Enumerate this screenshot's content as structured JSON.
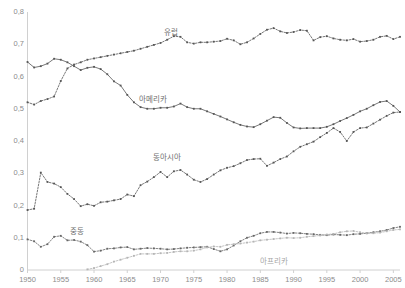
{
  "chart_data": {
    "type": "line",
    "title": "",
    "xlabel": "",
    "ylabel": "",
    "xlim": [
      1950,
      2006
    ],
    "ylim": [
      0,
      0.8
    ],
    "grid": false,
    "legend_position": "inline-annotations",
    "y_ticks": [
      "0",
      "0,1",
      "0,2",
      "0,3",
      "0,4",
      "0,5",
      "0,6",
      "0,7",
      "0,8"
    ],
    "y_tick_values": [
      0,
      0.1,
      0.2,
      0.3,
      0.4,
      0.5,
      0.6,
      0.7,
      0.8
    ],
    "x_ticks": [
      "1950",
      "1955",
      "1960",
      "1965",
      "1970",
      "1975",
      "1980",
      "1985",
      "1990",
      "1995",
      "2000",
      "2005"
    ],
    "x_tick_values": [
      1950,
      1955,
      1960,
      1965,
      1970,
      1975,
      1980,
      1985,
      1990,
      1995,
      2000,
      2005
    ],
    "x": [
      1950,
      1951,
      1952,
      1953,
      1954,
      1955,
      1956,
      1957,
      1958,
      1959,
      1960,
      1961,
      1962,
      1963,
      1964,
      1965,
      1966,
      1967,
      1968,
      1969,
      1970,
      1971,
      1972,
      1973,
      1974,
      1975,
      1976,
      1977,
      1978,
      1979,
      1980,
      1981,
      1982,
      1983,
      1984,
      1985,
      1986,
      1987,
      1988,
      1989,
      1990,
      1991,
      1992,
      1993,
      1994,
      1995,
      1996,
      1997,
      1998,
      1999,
      2000,
      2001,
      2002,
      2003,
      2004,
      2005,
      2006
    ],
    "series": [
      {
        "name": "유럽",
        "label_en": "Europe",
        "color": "#555555",
        "style": "dotted",
        "marker": "square",
        "label_x": 1971.5,
        "label_y": 0.742,
        "values": [
          0.52,
          0.513,
          0.524,
          0.53,
          0.538,
          0.586,
          0.625,
          0.637,
          0.644,
          0.652,
          0.656,
          0.66,
          0.664,
          0.668,
          0.672,
          0.676,
          0.68,
          0.686,
          0.692,
          0.698,
          0.704,
          0.714,
          0.725,
          0.723,
          0.706,
          0.702,
          0.706,
          0.706,
          0.708,
          0.71,
          0.717,
          0.712,
          0.7,
          0.706,
          0.718,
          0.732,
          0.745,
          0.75,
          0.74,
          0.735,
          0.738,
          0.744,
          0.742,
          0.712,
          0.722,
          0.725,
          0.718,
          0.714,
          0.712,
          0.716,
          0.708,
          0.71,
          0.714,
          0.723,
          0.726,
          0.716,
          0.723
        ]
      },
      {
        "name": "아메리카",
        "label_en": "America",
        "color": "#555555",
        "style": "solid",
        "marker": "square",
        "label_x": 1968.8,
        "label_y": 0.534,
        "values": [
          0.645,
          0.628,
          0.632,
          0.64,
          0.655,
          0.652,
          0.644,
          0.632,
          0.62,
          0.627,
          0.63,
          0.623,
          0.607,
          0.585,
          0.572,
          0.543,
          0.52,
          0.505,
          0.5,
          0.5,
          0.503,
          0.503,
          0.507,
          0.516,
          0.505,
          0.5,
          0.5,
          0.492,
          0.484,
          0.476,
          0.467,
          0.458,
          0.45,
          0.445,
          0.443,
          0.452,
          0.463,
          0.474,
          0.472,
          0.456,
          0.442,
          0.439,
          0.44,
          0.44,
          0.44,
          0.444,
          0.452,
          0.462,
          0.471,
          0.481,
          0.492,
          0.5,
          0.511,
          0.521,
          0.524,
          0.509,
          0.49
        ]
      },
      {
        "name": "동아시아",
        "label_en": "East Asia",
        "color": "#555555",
        "style": "dotted",
        "marker": "square",
        "label_x": 1971.0,
        "label_y": 0.353,
        "values": [
          0.186,
          0.19,
          0.302,
          0.273,
          0.268,
          0.257,
          0.236,
          0.22,
          0.198,
          0.204,
          0.199,
          0.21,
          0.212,
          0.216,
          0.22,
          0.234,
          0.229,
          0.263,
          0.274,
          0.288,
          0.304,
          0.288,
          0.306,
          0.31,
          0.296,
          0.28,
          0.273,
          0.282,
          0.296,
          0.309,
          0.317,
          0.322,
          0.331,
          0.341,
          0.344,
          0.345,
          0.323,
          0.333,
          0.344,
          0.352,
          0.368,
          0.382,
          0.39,
          0.398,
          0.412,
          0.425,
          0.44,
          0.428,
          0.4,
          0.428,
          0.44,
          0.442,
          0.454,
          0.466,
          0.478,
          0.488,
          0.49
        ]
      },
      {
        "name": "중동",
        "label_en": "Middle East",
        "color": "#666666",
        "style": "dotted",
        "marker": "square",
        "label_x": 1957.5,
        "label_y": 0.125,
        "values": [
          0.095,
          0.089,
          0.072,
          0.08,
          0.103,
          0.106,
          0.092,
          0.093,
          0.088,
          0.077,
          0.057,
          0.06,
          0.066,
          0.067,
          0.07,
          0.071,
          0.064,
          0.066,
          0.068,
          0.067,
          0.066,
          0.064,
          0.065,
          0.067,
          0.069,
          0.07,
          0.071,
          0.072,
          0.065,
          0.058,
          0.064,
          0.076,
          0.089,
          0.1,
          0.106,
          0.114,
          0.118,
          0.118,
          0.116,
          0.113,
          0.115,
          0.114,
          0.112,
          0.111,
          0.109,
          0.108,
          0.11,
          0.109,
          0.108,
          0.111,
          0.112,
          0.114,
          0.117,
          0.12,
          0.124,
          0.13,
          0.134
        ]
      },
      {
        "name": "아프리카",
        "label_en": "Africa",
        "color": "#b5b5b5",
        "style": "dotted",
        "marker": "square",
        "label_x": 1987.0,
        "label_y": 0.032,
        "values": [
          null,
          null,
          null,
          null,
          null,
          null,
          null,
          null,
          null,
          0.002,
          0.006,
          0.012,
          0.018,
          0.026,
          0.032,
          0.038,
          0.044,
          0.05,
          0.05,
          0.05,
          0.052,
          0.053,
          0.056,
          0.058,
          0.058,
          0.06,
          0.064,
          0.07,
          0.073,
          0.072,
          0.078,
          0.08,
          0.082,
          0.085,
          0.088,
          0.092,
          0.094,
          0.096,
          0.098,
          0.1,
          0.099,
          0.1,
          0.103,
          0.105,
          0.107,
          0.11,
          0.112,
          0.117,
          0.12,
          0.121,
          0.117,
          0.114,
          0.114,
          0.116,
          0.12,
          0.124,
          0.126
        ]
      }
    ]
  },
  "axes": {
    "axis_color": "#d0d0d0",
    "tick_label_color": "#8c8c8c"
  }
}
